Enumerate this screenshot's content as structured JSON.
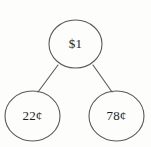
{
  "diagram": {
    "type": "number-bond-tree",
    "background_color": "#fdfdfc",
    "stroke_color": "#5a5a5a",
    "text_color": "#1d1d1d",
    "root": {
      "id": "root",
      "label": "$1",
      "cx": 75.5,
      "cy": 44,
      "rx": 26.5,
      "ry": 24
    },
    "children": [
      {
        "id": "left-child",
        "label": "22¢",
        "cx": 32.5,
        "cy": 116,
        "rx": 27.5,
        "ry": 25
      },
      {
        "id": "right-child",
        "label": "78¢",
        "cx": 116.5,
        "cy": 116,
        "rx": 27.5,
        "ry": 25
      }
    ],
    "edges": [
      {
        "id": "edge-root-left",
        "x1": 58,
        "y1": 65,
        "x2": 38,
        "y2": 92
      },
      {
        "id": "edge-root-right",
        "x1": 93,
        "y1": 65,
        "x2": 112,
        "y2": 92
      }
    ]
  }
}
